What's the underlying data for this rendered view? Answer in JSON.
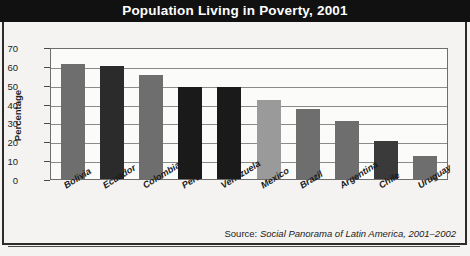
{
  "figure": {
    "title": "Population Living in Poverty, 2001",
    "source_label": "Source:",
    "source_title": "Social Panorama of Latin America, 2001–2002"
  },
  "chart_data": {
    "type": "bar",
    "title": "Population Living in Poverty, 2001",
    "xlabel": "",
    "ylabel": "Percentage",
    "ylim": [
      0,
      70
    ],
    "ytick_step": 10,
    "yticks": [
      "70",
      "60",
      "50",
      "40",
      "30",
      "20",
      "10",
      "0"
    ],
    "grid": true,
    "legend": "none",
    "categories": [
      "Bolivia",
      "Ecuador",
      "Colombia",
      "Peru",
      "Venezuela",
      "Mexico",
      "Brazil",
      "Argentina",
      "Chile",
      "Uruguay"
    ],
    "values": [
      61,
      60,
      55,
      49,
      49,
      42,
      37,
      31,
      20,
      12
    ],
    "bar_colors": [
      "#6e6e6e",
      "#2b2b2b",
      "#6e6e6e",
      "#1a1a1a",
      "#1a1a1a",
      "#9a9a9a",
      "#6e6e6e",
      "#6e6e6e",
      "#3a3a3a",
      "#6e6e6e"
    ],
    "annotations": [
      "Source: Social Panorama of Latin America, 2001–2002"
    ]
  },
  "colors": {
    "header_bg": "#111111",
    "header_text": "#ffffff",
    "page_bg": "#f4f3f1",
    "plot_bg": "#fbfbfa",
    "axis": "#6d6d6d",
    "grid": "#8a8a8a"
  }
}
